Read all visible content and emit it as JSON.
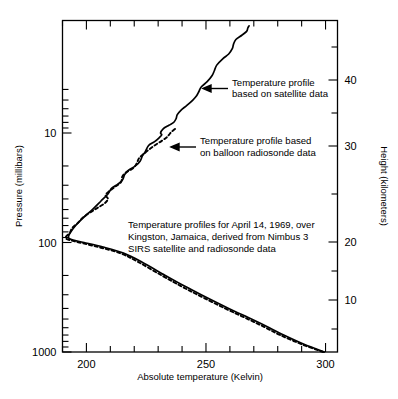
{
  "chart_data": {
    "type": "line",
    "title": "",
    "xlabel": "Absolute temperature (Kelvin)",
    "ylabel": "Pressure (millibars)",
    "y2label": "Height (kilometers)",
    "xlim": [
      190,
      305
    ],
    "ylim": [
      1000,
      4.2
    ],
    "yscale": "log",
    "y2lim": [
      4,
      47
    ],
    "grid": false,
    "legend_position": "inline-annotations",
    "xticks": [
      200,
      250,
      300
    ],
    "xticks_minor": [
      190,
      210,
      220,
      230,
      240,
      260,
      270,
      280,
      290
    ],
    "yticks": [
      10,
      100,
      1000
    ],
    "y2ticks": [
      10,
      20,
      30,
      40
    ],
    "series": [
      {
        "name": "Temperature profile based on satellite data",
        "style": "solid",
        "points": [
          [
            1000,
            299.5
          ],
          [
            850,
            291.0
          ],
          [
            700,
            282.5
          ],
          [
            600,
            276.5
          ],
          [
            500,
            269.0
          ],
          [
            400,
            259.5
          ],
          [
            300,
            248.0
          ],
          [
            250,
            241.0
          ],
          [
            200,
            233.0
          ],
          [
            150,
            223.0
          ],
          [
            125,
            215.5
          ],
          [
            110,
            207.0
          ],
          [
            100,
            199.0
          ],
          [
            95,
            194.5
          ],
          [
            92,
            192.8
          ],
          [
            88,
            192.5
          ],
          [
            80,
            193.5
          ],
          [
            70,
            195.5
          ],
          [
            60,
            198.5
          ],
          [
            50,
            202.5
          ],
          [
            42,
            206.0
          ],
          [
            36,
            209.0
          ],
          [
            32,
            210.5
          ],
          [
            30,
            212.5
          ],
          [
            27,
            215.0
          ],
          [
            24,
            216.0
          ],
          [
            22,
            217.5
          ],
          [
            20,
            220.5
          ],
          [
            18,
            222.5
          ],
          [
            16,
            223.5
          ],
          [
            15,
            224.5
          ],
          [
            13,
            226.0
          ],
          [
            12,
            228.5
          ],
          [
            11,
            230.5
          ],
          [
            10.4,
            231.5
          ],
          [
            10,
            231.0
          ],
          [
            9.2,
            232.0
          ],
          [
            8.5,
            234.5
          ],
          [
            8.0,
            236.5
          ],
          [
            7.4,
            237.5
          ],
          [
            6.8,
            238.0
          ],
          [
            6.2,
            239.5
          ],
          [
            5.6,
            242.0
          ],
          [
            5.0,
            244.5
          ],
          [
            4.6,
            246.0
          ],
          [
            4.2,
            247.0
          ],
          [
            3.8,
            248.0
          ],
          [
            3.4,
            250.5
          ],
          [
            3.0,
            252.5
          ],
          [
            2.7,
            253.5
          ],
          [
            2.4,
            254.5
          ],
          [
            2.1,
            257.0
          ],
          [
            1.9,
            259.5
          ],
          [
            1.7,
            261.0
          ],
          [
            1.55,
            261.5
          ],
          [
            1.4,
            262.5
          ],
          [
            1.28,
            265.0
          ],
          [
            1.18,
            267.0
          ],
          [
            1.1,
            267.5
          ],
          [
            1.05,
            268.0
          ]
        ]
      },
      {
        "name": "Temperature profile based on balloon radiosonde data",
        "style": "dashed",
        "points": [
          [
            1000,
            299.0
          ],
          [
            850,
            290.0
          ],
          [
            700,
            281.0
          ],
          [
            600,
            275.0
          ],
          [
            500,
            267.5
          ],
          [
            400,
            258.0
          ],
          [
            300,
            246.5
          ],
          [
            250,
            239.5
          ],
          [
            200,
            231.5
          ],
          [
            150,
            221.5
          ],
          [
            125,
            214.0
          ],
          [
            110,
            205.0
          ],
          [
            100,
            197.0
          ],
          [
            95,
            193.0
          ],
          [
            92,
            191.5
          ],
          [
            88,
            191.5
          ],
          [
            82,
            193.0
          ],
          [
            74,
            194.0
          ],
          [
            66,
            196.5
          ],
          [
            58,
            199.0
          ],
          [
            50,
            203.5
          ],
          [
            44,
            207.5
          ],
          [
            40,
            209.0
          ],
          [
            37,
            208.0
          ],
          [
            34,
            209.5
          ],
          [
            31,
            212.0
          ],
          [
            28,
            214.5
          ],
          [
            25,
            215.0
          ],
          [
            23,
            216.5
          ],
          [
            21,
            219.5
          ],
          [
            19,
            221.0
          ],
          [
            17,
            222.0
          ],
          [
            15.5,
            224.0
          ],
          [
            14,
            226.5
          ],
          [
            12.8,
            229.0
          ],
          [
            11.8,
            231.5
          ],
          [
            11.0,
            233.5
          ],
          [
            10.4,
            234.5
          ],
          [
            9.8,
            235.5
          ],
          [
            9.4,
            236.5
          ],
          [
            9.0,
            237.5
          ]
        ]
      }
    ],
    "annotations": [
      {
        "id": "satellite-callout",
        "lines": [
          "Temperature profile",
          "based on satellite data"
        ],
        "arrow": true
      },
      {
        "id": "radiosonde-callout",
        "lines": [
          "Temperature profile based",
          "on balloon radiosonde data"
        ],
        "arrow": true
      },
      {
        "id": "caption",
        "lines": [
          "Temperature profiles for April 14, 1969, over",
          "Kingston, Jamaica, derived from Nimbus 3",
          "SIRS satellite and radiosonde data"
        ],
        "arrow": false
      }
    ]
  },
  "colors": {
    "line": "#000000",
    "axis": "#000000",
    "background": "#ffffff"
  }
}
